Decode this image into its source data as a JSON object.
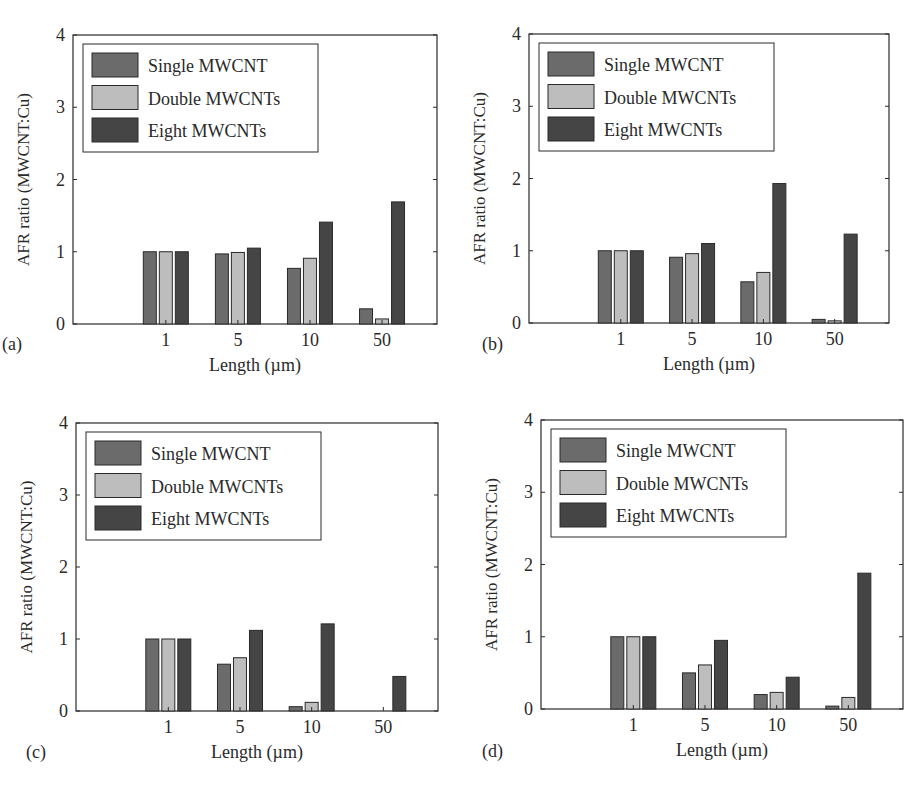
{
  "figure": {
    "legend": [
      "Single MWCNT",
      "Double MWCNTs",
      "Eight MWCNTs"
    ],
    "colors": {
      "single": "#6b6b6b",
      "double": "#bdbdbd",
      "eight": "#454545",
      "edge": "#2a2a2a"
    }
  },
  "chart_data": [
    {
      "type": "bar",
      "panel_label": "(a)",
      "title": "",
      "xlabel": "Length (µm)",
      "ylabel": "AFR ratio (MWCNT:Cu)",
      "categories": [
        "1",
        "5",
        "10",
        "50"
      ],
      "yticks": [
        "0",
        "1",
        "2",
        "3",
        "4"
      ],
      "ylim": [
        0,
        4
      ],
      "legend_position": "upper left",
      "grid": false,
      "series": [
        {
          "name": "Single MWCNT",
          "values": [
            1.0,
            0.97,
            0.77,
            0.21
          ]
        },
        {
          "name": "Double MWCNTs",
          "values": [
            1.0,
            0.99,
            0.91,
            0.07
          ]
        },
        {
          "name": "Eight MWCNTs",
          "values": [
            1.0,
            1.05,
            1.41,
            1.69
          ]
        }
      ]
    },
    {
      "type": "bar",
      "panel_label": "(b)",
      "title": "",
      "xlabel": "Length (µm)",
      "ylabel": "AFR ratio (MWCNT:Cu)",
      "categories": [
        "1",
        "5",
        "10",
        "50"
      ],
      "yticks": [
        "0",
        "1",
        "2",
        "3",
        "4"
      ],
      "ylim": [
        0,
        4
      ],
      "legend_position": "upper left",
      "grid": false,
      "series": [
        {
          "name": "Single MWCNT",
          "values": [
            1.0,
            0.91,
            0.57,
            0.05
          ]
        },
        {
          "name": "Double MWCNTs",
          "values": [
            1.0,
            0.96,
            0.7,
            0.03
          ]
        },
        {
          "name": "Eight MWCNTs",
          "values": [
            1.0,
            1.1,
            1.93,
            1.23
          ]
        }
      ]
    },
    {
      "type": "bar",
      "panel_label": "(c)",
      "title": "",
      "xlabel": "Length (µm)",
      "ylabel": "AFR ratio (MWCNT:Cu)",
      "categories": [
        "1",
        "5",
        "10",
        "50"
      ],
      "yticks": [
        "0",
        "1",
        "2",
        "3",
        "4"
      ],
      "ylim": [
        0,
        4
      ],
      "legend_position": "upper left",
      "grid": false,
      "series": [
        {
          "name": "Single MWCNT",
          "values": [
            1.0,
            0.65,
            0.06,
            0.0
          ]
        },
        {
          "name": "Double MWCNTs",
          "values": [
            1.0,
            0.74,
            0.12,
            0.0
          ]
        },
        {
          "name": "Eight MWCNTs",
          "values": [
            1.0,
            1.12,
            1.21,
            0.48
          ]
        }
      ]
    },
    {
      "type": "bar",
      "panel_label": "(d)",
      "title": "",
      "xlabel": "Length (µm)",
      "ylabel": "AFR ratio (MWCNT:Cu)",
      "categories": [
        "1",
        "5",
        "10",
        "50"
      ],
      "yticks": [
        "0",
        "1",
        "2",
        "3",
        "4"
      ],
      "ylim": [
        0,
        4
      ],
      "legend_position": "upper left",
      "grid": false,
      "series": [
        {
          "name": "Single MWCNT",
          "values": [
            1.0,
            0.5,
            0.2,
            0.04
          ]
        },
        {
          "name": "Double MWCNTs",
          "values": [
            1.0,
            0.61,
            0.23,
            0.16
          ]
        },
        {
          "name": "Eight MWCNTs",
          "values": [
            1.0,
            0.95,
            0.44,
            1.88
          ]
        }
      ]
    }
  ],
  "layout": {
    "panels": [
      {
        "x0": 73,
        "y0": 35,
        "w": 364,
        "h": 289,
        "label_x": 2,
        "label_y": 350
      },
      {
        "x0": 529,
        "y0": 34,
        "w": 360,
        "h": 289,
        "label_x": 482,
        "label_y": 350
      },
      {
        "x0": 76,
        "y0": 423,
        "w": 362,
        "h": 288,
        "label_x": 26,
        "label_y": 758
      },
      {
        "x0": 541,
        "y0": 420,
        "w": 362,
        "h": 289,
        "label_x": 482,
        "label_y": 757
      }
    ]
  }
}
